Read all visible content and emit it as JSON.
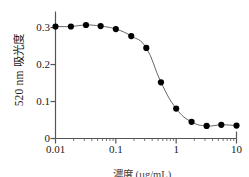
{
  "chart_data": {
    "type": "line",
    "title": "",
    "subtitle": "",
    "xlabel": "濃度 (µg/mL)",
    "ylabel": "520 nm 吸光度",
    "xscale": "log",
    "yscale": "linear",
    "xlim": [
      0.01,
      10
    ],
    "ylim": [
      0,
      0.33
    ],
    "grid": false,
    "legend": null,
    "legend_position": "none",
    "marker": "filled-circle",
    "marker_color": "#000000",
    "line_color": "#555555",
    "axis_color": "#555555",
    "x": [
      0.01,
      0.018,
      0.032,
      0.056,
      0.1,
      0.18,
      0.32,
      0.56,
      1.0,
      1.8,
      3.2,
      5.6,
      10.0
    ],
    "y": [
      0.303,
      0.303,
      0.307,
      0.304,
      0.296,
      0.277,
      0.245,
      0.152,
      0.081,
      0.045,
      0.034,
      0.037,
      0.035
    ],
    "series": [
      {
        "name": "520 nm absorbance",
        "x": [
          0.01,
          0.018,
          0.032,
          0.056,
          0.1,
          0.18,
          0.32,
          0.56,
          1.0,
          1.8,
          3.2,
          5.6,
          10.0
        ],
        "values": [
          0.303,
          0.303,
          0.307,
          0.304,
          0.296,
          0.277,
          0.245,
          0.152,
          0.081,
          0.045,
          0.034,
          0.037,
          0.035
        ]
      }
    ],
    "xticks": [
      {
        "value": 0.01,
        "label": "0.01"
      },
      {
        "value": 0.1,
        "label": "0.1"
      },
      {
        "value": 1,
        "label": "1"
      },
      {
        "value": 10,
        "label": "10"
      }
    ],
    "yticks": [
      {
        "value": 0,
        "label": "0"
      },
      {
        "value": 0.1,
        "label": "0.1"
      },
      {
        "value": 0.2,
        "label": "0.2"
      },
      {
        "value": 0.3,
        "label": "0.3"
      }
    ],
    "annotations": []
  }
}
